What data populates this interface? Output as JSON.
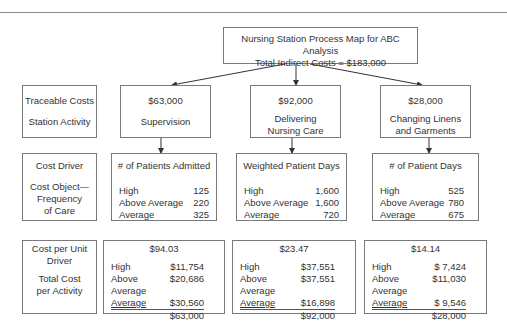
{
  "title": {
    "line1": "Nursing Station Process Map for ABC Analysis",
    "line2": "Total Indirect Costs = $183,000"
  },
  "row_labels": {
    "traceable": {
      "line1": "Traceable Costs",
      "line2": "Station Activity"
    },
    "driver": {
      "line1": "Cost Driver",
      "line2": "Cost Object—",
      "line3": "Frequency",
      "line4": "of Care"
    },
    "cost": {
      "line1": "Cost per Unit",
      "line2": "Driver",
      "line3": "Total Cost",
      "line4": "per Activity"
    }
  },
  "activities": [
    {
      "cost": "$63,000",
      "name_line1": "Supervision",
      "name_line2": "",
      "driver": "# of Patients Admitted",
      "driver_values": [
        {
          "label": "High",
          "value": "125"
        },
        {
          "label": "Above Average",
          "value": "220"
        },
        {
          "label": "Average",
          "value": "325"
        }
      ],
      "unit_cost": "$94.03",
      "allocations": [
        {
          "label": "High",
          "value": "$11,754"
        },
        {
          "label": "Above Average",
          "value": "$20,686"
        },
        {
          "label": "Average",
          "value": "$30,560"
        }
      ],
      "total": "$63,000"
    },
    {
      "cost": "$92,000",
      "name_line1": "Delivering",
      "name_line2": "Nursing Care",
      "driver": "Weighted Patient Days",
      "driver_values": [
        {
          "label": "High",
          "value": "1,600"
        },
        {
          "label": "Above Average",
          "value": "1,600"
        },
        {
          "label": "Average",
          "value": "720"
        }
      ],
      "unit_cost": "$23.47",
      "allocations": [
        {
          "label": "High",
          "value": "$37,551"
        },
        {
          "label": "Above Average",
          "value": "$37,551"
        },
        {
          "label": "Average",
          "value": "$16,898"
        }
      ],
      "total": "$92,000"
    },
    {
      "cost": "$28,000",
      "name_line1": "Changing Linens",
      "name_line2": "and Garments",
      "driver": "# of Patient Days",
      "driver_values": [
        {
          "label": "High",
          "value": "525"
        },
        {
          "label": "Above Average",
          "value": "780"
        },
        {
          "label": "Average",
          "value": "675"
        }
      ],
      "unit_cost": "$14.14",
      "allocations": [
        {
          "label": "High",
          "value": "$ 7,424"
        },
        {
          "label": "Above Average",
          "value": "$11,030"
        },
        {
          "label": "Average",
          "value": "$ 9,546"
        }
      ],
      "total": "$28,000"
    }
  ]
}
